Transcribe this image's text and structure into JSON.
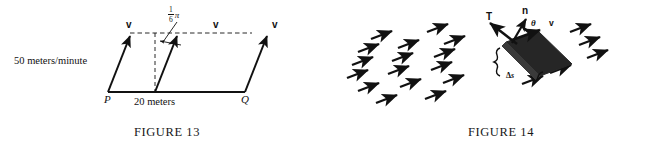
{
  "page": {
    "background_color": "#ffffff",
    "ink_color": "#111111",
    "width": 668,
    "height": 143
  },
  "figures": [
    {
      "id": "figure-13",
      "caption": "FIGURE 13",
      "description": "Parallelogram of fluid flow across segment PQ with three velocity vectors v inclined at one-sixth pi from the vertical.",
      "labels": {
        "speed": "50 meters/minute",
        "base_length": "20 meters",
        "point_left": "P",
        "point_right": "Q",
        "angle_numerator": "1",
        "angle_denominator": "6",
        "angle_symbol": "π",
        "vector_1": "v",
        "vector_2": "v",
        "vector_3": "v"
      },
      "geometry": {
        "baseline_y": 92,
        "top_dashed_y": 33,
        "base_left_x": 108,
        "base_right_x": 245,
        "shear_dx": 22,
        "vector_count": 3,
        "angle_radians_text": "π/6"
      }
    },
    {
      "id": "figure-14",
      "caption": "FIGURE 14",
      "description": "A flat plate of width delta-s immersed in a uniform rightward-tilted flow field, with unit tangent T, unit normal n, velocity v and angle theta between n and v.",
      "labels": {
        "tangent": "T",
        "normal": "n",
        "angle": "θ",
        "velocity": "v",
        "width_delta": "Δ",
        "width_var": "s"
      },
      "geometry": {
        "plate_fill": "#262626",
        "arrow_rows": 6,
        "arrow_angle_deg": -22
      }
    }
  ]
}
